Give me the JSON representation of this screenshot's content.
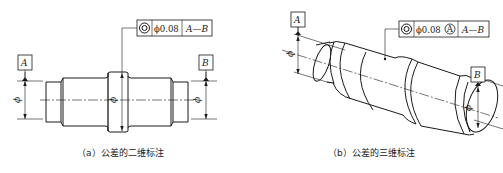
{
  "figure_a": {
    "caption": "（a）公差的二维标注",
    "frame": {
      "symbol": "concentricity-icon",
      "tolerance": "ϕ0.08",
      "datum": "A—B"
    },
    "datum_left": "A",
    "datum_right": "B",
    "dim_symbol": "ϕ"
  },
  "figure_b": {
    "caption": "（b）公差的三维标注",
    "frame": {
      "symbol": "concentricity-icon",
      "tolerance": "ϕ0.08",
      "modifier": "A",
      "datum": "A—B"
    },
    "datum_left": "A",
    "datum_right": "B",
    "dim_symbol": "ϕ"
  }
}
